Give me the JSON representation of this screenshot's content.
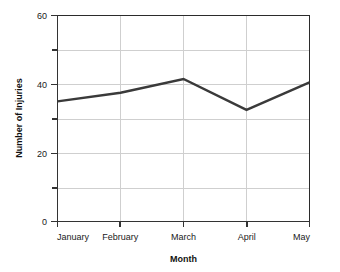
{
  "chart_data": {
    "type": "line",
    "title": "",
    "xlabel": "Month",
    "ylabel": "Number of Injuries",
    "categories": [
      "January",
      "February",
      "March",
      "April",
      "May"
    ],
    "series": [
      {
        "name": "Number of Injuries",
        "values": [
          35,
          37.5,
          41.5,
          32.5,
          40.5
        ],
        "color": "#3a3a3a"
      }
    ],
    "ylim": [
      0,
      60
    ],
    "y_major_ticks": [
      0,
      20,
      40,
      60
    ],
    "y_major_tick_labels": [
      "0",
      "20",
      "40",
      "60"
    ],
    "y_minor_ticks": [
      10,
      30,
      50
    ],
    "grid": true,
    "grid_color": "#cfcfcf",
    "legend": false,
    "legend_position": "none",
    "background": "#ffffff",
    "frame_color": "#2b2b2b"
  },
  "axes": {
    "y_title": "Number of Injuries",
    "x_title": "Month",
    "y_labels": {
      "t0": "0",
      "t20": "20",
      "t40": "40",
      "t60": "60"
    },
    "x_labels": {
      "c0": "January",
      "c1": "February",
      "c2": "March",
      "c3": "April",
      "c4": "May"
    }
  }
}
